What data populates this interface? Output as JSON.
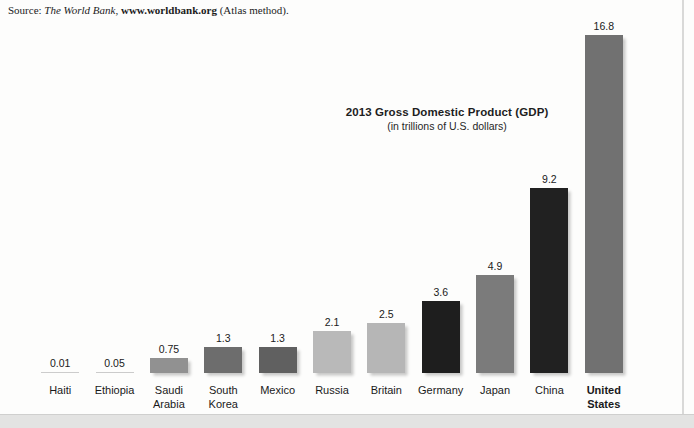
{
  "source": {
    "prefix": "Source: ",
    "publisher": "The World Bank",
    "separator": ", ",
    "url": "www.worldbank.org",
    "suffix": " (Atlas method)."
  },
  "chart": {
    "title": "2013 Gross Domestic Product (GDP)",
    "subtitle": "(in trillions of U.S. dollars)"
  },
  "chart_data": {
    "type": "bar",
    "title": "2013 Gross Domestic Product (GDP)",
    "subtitle": "(in trillions of U.S. dollars)",
    "source_text": "Source: The World Bank, www.worldbank.org (Atlas method).",
    "unit": "trillions of U.S. dollars",
    "xlabel": "",
    "ylabel": "",
    "ylim": [
      0,
      17
    ],
    "grid": false,
    "legend": false,
    "categories": [
      "Haiti",
      "Ethiopia",
      "Saudi Arabia",
      "South Korea",
      "Mexico",
      "Russia",
      "Britain",
      "Germany",
      "Japan",
      "China",
      "United States"
    ],
    "values": [
      0.01,
      0.05,
      0.75,
      1.3,
      1.3,
      2.1,
      2.5,
      3.6,
      4.9,
      9.2,
      16.8
    ],
    "bars": [
      {
        "label": "Haiti",
        "value": 0.01,
        "value_label": "0.01",
        "color": "#cccccc",
        "bold": false
      },
      {
        "label": "Ethiopia",
        "value": 0.05,
        "value_label": "0.05",
        "color": "#cbcbcb",
        "bold": false
      },
      {
        "label": "Saudi\nArabia",
        "value": 0.75,
        "value_label": "0.75",
        "color": "#919191",
        "bold": false
      },
      {
        "label": "South\nKorea",
        "value": 1.3,
        "value_label": "1.3",
        "color": "#6d6d6d",
        "bold": false
      },
      {
        "label": "Mexico",
        "value": 1.3,
        "value_label": "1.3",
        "color": "#606060",
        "bold": false
      },
      {
        "label": "Russia",
        "value": 2.1,
        "value_label": "2.1",
        "color": "#b9b9b9",
        "bold": false
      },
      {
        "label": "Britain",
        "value": 2.5,
        "value_label": "2.5",
        "color": "#b6b6b6",
        "bold": false
      },
      {
        "label": "Germany",
        "value": 3.6,
        "value_label": "3.6",
        "color": "#1e1e1e",
        "bold": false
      },
      {
        "label": "Japan",
        "value": 4.9,
        "value_label": "4.9",
        "color": "#7b7b7b",
        "bold": false
      },
      {
        "label": "China",
        "value": 9.2,
        "value_label": "9.2",
        "color": "#212121",
        "bold": false
      },
      {
        "label": "United\nStates",
        "value": 16.8,
        "value_label": "16.8",
        "color": "#717171",
        "bold": true
      }
    ],
    "colors_note": {
      "light_gray": "#b8b8b8",
      "medium_gray": "#8e8e8e",
      "dark_gray": "#606060",
      "near_black": "#1f1f1f"
    }
  },
  "page": {
    "background": "#fdfdfc",
    "bottom_band_color": "#e3e3e2",
    "edge_rule_color": "#d9d9d8"
  }
}
